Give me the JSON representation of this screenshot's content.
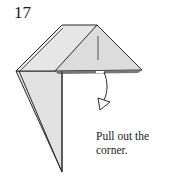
{
  "step": {
    "number": "17"
  },
  "instruction": {
    "line1": "Pull out the",
    "line2": "corner."
  },
  "colors": {
    "paper_fill": "#e4e4e4",
    "paper_inner": "#d9d9d9",
    "line": "#2a2a2a",
    "shadow": "#555555",
    "background": "#ffffff"
  },
  "icons": {
    "arrow": "pull-arrow-icon"
  }
}
